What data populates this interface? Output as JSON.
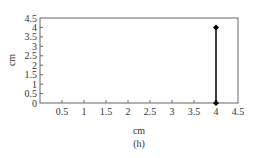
{
  "chart_data": {
    "type": "line",
    "title": "",
    "caption": "(h)",
    "xlabel": "cm",
    "ylabel": "cm",
    "xlim": [
      0,
      4.5
    ],
    "ylim": [
      0,
      4.5
    ],
    "x_ticks": [
      "0.5",
      "1",
      "1.5",
      "2",
      "2.5",
      "3",
      "3.5",
      "4",
      "4.5"
    ],
    "y_ticks": [
      "0",
      "0.5",
      "1",
      "1.5",
      "2",
      "2.5",
      "3",
      "3.5",
      "4",
      "4.5"
    ],
    "grid": false,
    "legend": null,
    "series": [
      {
        "name": "segment",
        "x": [
          4,
          4
        ],
        "y": [
          0,
          4
        ],
        "marker": "diamond",
        "color": "#000000"
      }
    ]
  },
  "colors": {
    "axis": "#555555",
    "line": "#000000",
    "background": "#ffffff"
  }
}
